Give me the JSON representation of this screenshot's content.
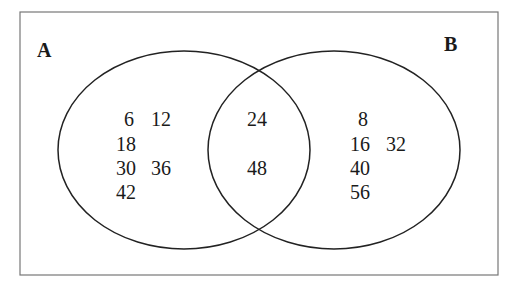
{
  "diagram": {
    "type": "venn",
    "sets": [
      {
        "name": "A",
        "only": [
          "6",
          "12",
          "18",
          "30",
          "36",
          "42"
        ]
      },
      {
        "name": "B",
        "only": [
          "8",
          "16",
          "32",
          "40",
          "56"
        ]
      }
    ],
    "intersection": [
      "24",
      "48"
    ],
    "labels": {
      "a": "A",
      "b": "B"
    },
    "a_only": {
      "r1c1": "6",
      "r1c2": "12",
      "r2c1": "18",
      "r3c1": "30",
      "r3c2": "36",
      "r4c1": "42"
    },
    "both": {
      "r1": "24",
      "r2": "48"
    },
    "b_only": {
      "r1c1": "8",
      "r2c1": "16",
      "r2c2": "32",
      "r3c1": "40",
      "r4c1": "56"
    }
  }
}
